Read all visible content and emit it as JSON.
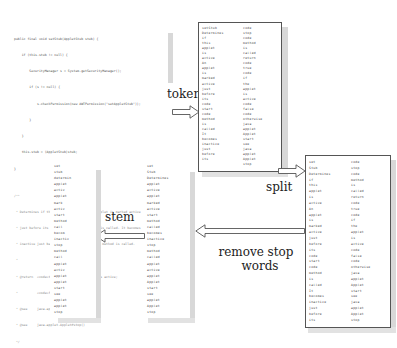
{
  "code_panel": {
    "lines": [
      "public final void setStub(AppletStub stub) {",
      "    if (this.stub != null) {",
      "        SecurityManager s = System.getSecurityManager();",
      "        if (s != null) {",
      "            s.checkPermission(new AWTPermission(\"setAppletStub\"));",
      "        }",
      "    }",
      "    this.stub = (AppletStub)stub;",
      "}",
      "",
      "/**",
      " * Determines if this applet is active. An applet is marked active",
      " * just before its <code>start</code> method is called. It becomes",
      " * inactive just before its <code>stop</code> method is called.",
      " *",
      " * @return  <code>true</code> if the applet is active;",
      " *          <code>false</code> otherwise.",
      " * @see     java.applet.Applet#start()",
      " * @see     java.applet.Applet#stop()",
      " */"
    ]
  },
  "steps": {
    "tokenize": "tokenize",
    "split": "split",
    "remove_stop_words_line1": "remove stop",
    "remove_stop_words_line2": "words",
    "stem": "stem"
  },
  "tokenize_panel": {
    "col1": [
      "setStub",
      "Determines",
      "if",
      "this",
      "applet",
      "is",
      "active",
      "An",
      "applet",
      "is",
      "marked",
      "active",
      "just",
      "before",
      "its",
      "code",
      "start",
      "code",
      "method",
      "is",
      "called",
      "It",
      "becomes",
      "inactive",
      "just",
      "before",
      "its"
    ],
    "col2": [
      "code",
      "stop",
      "code",
      "method",
      "is",
      "called",
      "return",
      "code",
      "true",
      "code",
      "if",
      "the",
      "applet",
      "is",
      "active",
      "code",
      "false",
      "code",
      "otherwise",
      "java",
      "applet",
      "Applet",
      "start",
      "see",
      "java",
      "applet",
      "Applet",
      "stop"
    ]
  },
  "split_panel": {
    "col1": [
      "set",
      "Stub",
      "Determines",
      "if",
      "this",
      "applet",
      "is",
      "active",
      "An",
      "applet",
      "is",
      "marked",
      "active",
      "just",
      "before",
      "its",
      "code",
      "start",
      "code",
      "method",
      "is",
      "called",
      "It",
      "becomes",
      "inactive",
      "just",
      "before",
      "its"
    ],
    "col2": [
      "code",
      "stop",
      "code",
      "method",
      "is",
      "called",
      "return",
      "code",
      "true",
      "code",
      "if",
      "the",
      "applet",
      "is",
      "active",
      "code",
      "false",
      "code",
      "otherwise",
      "java",
      "applet",
      "Applet",
      "start",
      "see",
      "java",
      "applet",
      "Applet",
      "stop"
    ]
  },
  "stopword_panel": {
    "words": [
      "set",
      "Stub",
      "Determines",
      "applet",
      "active",
      "applet",
      "marked",
      "active",
      "start",
      "method",
      "called",
      "becomes",
      "inactive",
      "stop",
      "method",
      "called",
      "applet",
      "active",
      "applet",
      "Applet",
      "start",
      "see",
      "applet",
      "Applet",
      "stop"
    ]
  },
  "stem_panel": {
    "words": [
      "set",
      "stub",
      "determin",
      "applet",
      "activ",
      "applet",
      "mark",
      "activ",
      "start",
      "method",
      "call",
      "becom",
      "inactiv",
      "stop",
      "method",
      "call",
      "applet",
      "activ",
      "applet",
      "applet",
      "start",
      "see",
      "applet",
      "applet",
      "stop"
    ]
  }
}
